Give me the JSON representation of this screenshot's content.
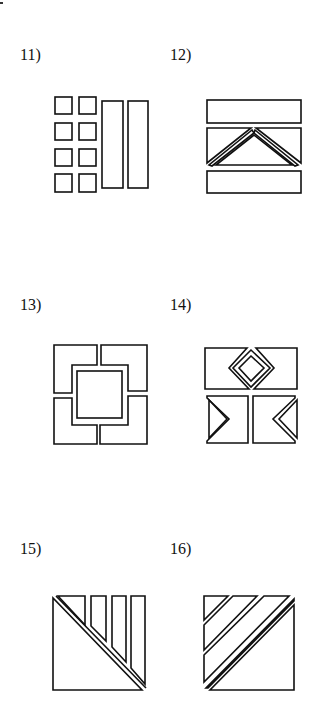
{
  "page": {
    "problems": [
      {
        "label": "11)",
        "description": "square tiled with eight small squares in two columns and two tall rectangles"
      },
      {
        "label": "12)",
        "description": "square with top and bottom bars and middle band containing a chevron"
      },
      {
        "label": "13)",
        "description": "square of four L-shaped pieces around a central square"
      },
      {
        "label": "14)",
        "description": "square with two top rectangles around a diamond and two bottom squares with chevron notches"
      },
      {
        "label": "15)",
        "description": "square split by diagonal with triangle and three tapered strips"
      },
      {
        "label": "16)",
        "description": "square with triangle corner, diagonal strips and large lower triangle"
      }
    ]
  }
}
